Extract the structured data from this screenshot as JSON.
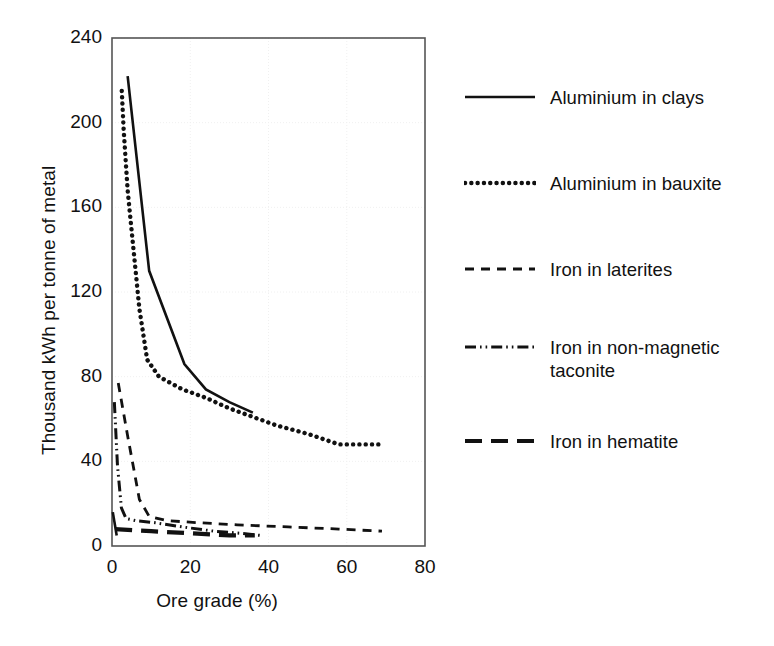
{
  "chart_data": {
    "type": "line",
    "title": "",
    "xlabel": "Ore grade (%)",
    "ylabel": "Thousand kWh per tonne of metal",
    "xlim": [
      0,
      80
    ],
    "ylim": [
      0,
      240
    ],
    "xticks": [
      0,
      20,
      40,
      60,
      80
    ],
    "yticks": [
      0,
      40,
      80,
      120,
      160,
      200,
      240
    ],
    "grid": "faint dotted gridlines at major ticks",
    "legend_position": "right",
    "series": [
      {
        "name": "Aluminium in clays",
        "style": "solid",
        "points": [
          [
            0.2,
            16
          ],
          [
            1.2,
            5
          ]
        ],
        "points2": [
          [
            4.0,
            222
          ],
          [
            9.5,
            130
          ],
          [
            18.5,
            86
          ],
          [
            24.0,
            74
          ],
          [
            30.0,
            68
          ],
          [
            36.0,
            63
          ]
        ]
      },
      {
        "name": "Aluminium in bauxite",
        "style": "dotted",
        "points": [
          [
            2.5,
            215
          ],
          [
            3.0,
            196
          ],
          [
            4.0,
            168
          ],
          [
            5.5,
            140
          ],
          [
            7.0,
            112
          ],
          [
            9.0,
            88
          ],
          [
            12.0,
            80
          ],
          [
            18.0,
            74
          ],
          [
            24.0,
            70
          ],
          [
            30.0,
            65
          ],
          [
            36.0,
            61
          ],
          [
            42.0,
            57
          ],
          [
            50.0,
            53
          ],
          [
            58.0,
            48
          ],
          [
            69.0,
            48
          ]
        ]
      },
      {
        "name": "Iron in laterites",
        "style": "dashed",
        "points": [
          [
            1.6,
            77
          ],
          [
            4.0,
            52
          ],
          [
            7.0,
            22
          ],
          [
            9.5,
            14
          ],
          [
            14.0,
            12
          ],
          [
            22.0,
            11
          ],
          [
            32.0,
            10
          ],
          [
            45.0,
            9
          ],
          [
            58.0,
            8
          ],
          [
            69.0,
            7
          ]
        ]
      },
      {
        "name": "Iron in non-magnetic taconite",
        "style": "dashdotdot",
        "points": [
          [
            0.6,
            68
          ],
          [
            1.4,
            38
          ],
          [
            2.4,
            18
          ],
          [
            3.6,
            13
          ],
          [
            6.0,
            12
          ],
          [
            11.0,
            11
          ],
          [
            18.0,
            9
          ],
          [
            26.0,
            7
          ],
          [
            33.0,
            6
          ],
          [
            38.0,
            5
          ]
        ]
      },
      {
        "name": "Iron in hematite",
        "style": "longdash",
        "points": [
          [
            0.8,
            8
          ],
          [
            10.0,
            7
          ],
          [
            20.0,
            6
          ],
          [
            30.0,
            5
          ],
          [
            36.5,
            5
          ]
        ]
      }
    ]
  },
  "axes": {
    "x_tick_labels": [
      "0",
      "20",
      "40",
      "60",
      "80"
    ],
    "y_tick_labels": [
      "0",
      "40",
      "80",
      "120",
      "160",
      "200",
      "240"
    ],
    "x_title": "Ore grade (%)",
    "y_title": "Thousand kWh per tonne of metal"
  },
  "legend": {
    "entries": [
      {
        "label": "Aluminium in clays",
        "style": "solid"
      },
      {
        "label": "Aluminium in bauxite",
        "style": "dotted"
      },
      {
        "label": "Iron in laterites",
        "style": "dashed"
      },
      {
        "label": "Iron in non-magnetic taconite",
        "style": "dashdotdot"
      },
      {
        "label": "Iron in hematite",
        "style": "longdash"
      }
    ]
  },
  "colors": {
    "line": "#111111",
    "axis": "#555555",
    "grid": "#f0f0f0",
    "background": "#ffffff"
  }
}
